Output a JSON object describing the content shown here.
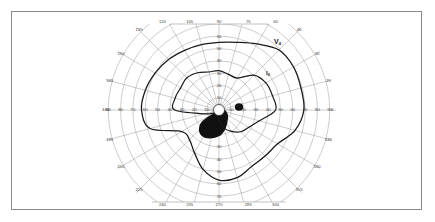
{
  "figure": {
    "type": "Goldmann kinetic perimetry visual field chart",
    "colors": {
      "grid": "#9a9a9a",
      "isopter": "#1a1a1a",
      "scotoma": "#111111",
      "frame": "#8a8a8a",
      "background": "#ffffff"
    }
  },
  "grid": {
    "meridian_labels": [
      "0",
      "15",
      "30",
      "45",
      "60",
      "75",
      "90",
      "105",
      "120",
      "135",
      "150",
      "165",
      "180",
      "195",
      "210",
      "225",
      "240",
      "255",
      "270",
      "285",
      "300",
      "315",
      "330",
      "345"
    ],
    "ring_labels_horizontal_left": [
      "90",
      "80",
      "70",
      "60",
      "50",
      "40",
      "30",
      "20",
      "10"
    ],
    "ring_labels_horizontal_right": [
      "10",
      "20",
      "30",
      "40",
      "50",
      "60",
      "70",
      "80",
      "90"
    ],
    "ring_labels_vertical_up": [
      "10",
      "20",
      "30",
      "40",
      "50",
      "60"
    ],
    "ring_labels_vertical_down": [
      "10",
      "20",
      "30",
      "40",
      "50",
      "60",
      "70"
    ]
  },
  "isopters": [
    {
      "label": "V4",
      "main": "V",
      "sub": "4"
    },
    {
      "label": "I4",
      "main": "I",
      "sub": "4"
    }
  ],
  "chart_data": {
    "type": "polar",
    "title": "",
    "radial_unit": "degrees eccentricity",
    "radial_range": [
      0,
      90
    ],
    "ring_step": 10,
    "meridian_step_deg": 15,
    "series": [
      {
        "name": "V4 isopter",
        "points_angle_radius": [
          [
            0,
            69
          ],
          [
            15,
            69
          ],
          [
            30,
            70
          ],
          [
            45,
            69
          ],
          [
            60,
            62
          ],
          [
            75,
            57
          ],
          [
            90,
            55
          ],
          [
            105,
            55
          ],
          [
            120,
            56
          ],
          [
            135,
            58
          ],
          [
            150,
            60
          ],
          [
            165,
            62
          ],
          [
            180,
            63
          ],
          [
            195,
            58
          ],
          [
            210,
            35
          ],
          [
            225,
            34
          ],
          [
            240,
            40
          ],
          [
            255,
            50
          ],
          [
            270,
            57
          ],
          [
            285,
            57
          ],
          [
            300,
            53
          ],
          [
            315,
            53
          ],
          [
            330,
            55
          ],
          [
            345,
            64
          ]
        ]
      },
      {
        "name": "I4 isopter",
        "points_angle_radius": [
          [
            0,
            46
          ],
          [
            15,
            45
          ],
          [
            30,
            44
          ],
          [
            45,
            40
          ],
          [
            60,
            30
          ],
          [
            75,
            30
          ],
          [
            90,
            32
          ],
          [
            105,
            32
          ],
          [
            120,
            35
          ],
          [
            135,
            37
          ],
          [
            150,
            36
          ],
          [
            165,
            37
          ],
          [
            180,
            36
          ],
          [
            195,
            12
          ],
          [
            210,
            5
          ],
          [
            240,
            4
          ],
          [
            270,
            8
          ],
          [
            285,
            15
          ],
          [
            300,
            20
          ],
          [
            315,
            25
          ],
          [
            330,
            28
          ],
          [
            345,
            34
          ]
        ]
      }
    ],
    "scotomas": [
      {
        "name": "blind spot (physiologic)",
        "center_angle_deg": 0,
        "center_radius_deg": 15,
        "approx_size_deg": 6
      },
      {
        "name": "dense central/inferonasal scotoma",
        "center_angle_deg": 250,
        "center_radius_deg": 14,
        "approx_size_deg": 18
      }
    ],
    "annotations": [
      "V4",
      "I4"
    ]
  }
}
